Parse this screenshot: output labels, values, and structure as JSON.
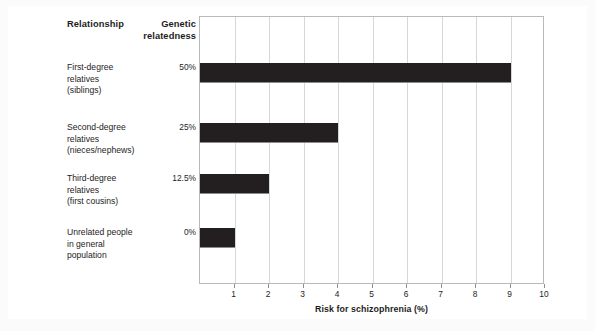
{
  "chart_data": {
    "type": "bar",
    "orientation": "horizontal",
    "title": "",
    "xlabel": "Risk for schizophrenia (%)",
    "ylabel": "",
    "xlim": [
      0,
      10
    ],
    "xticks": [
      "1",
      "2",
      "3",
      "4",
      "5",
      "6",
      "7",
      "8",
      "9",
      "10"
    ],
    "xtick_values": [
      1,
      2,
      3,
      4,
      5,
      6,
      7,
      8,
      9,
      10
    ],
    "grid": "vertical",
    "legend": "none",
    "bar_color": "#231f20",
    "categories": [
      "First-degree relatives (siblings)",
      "Second-degree relatives (nieces/nephews)",
      "Third-degree relatives (first cousins)",
      "Unrelated people in general population"
    ],
    "values": [
      9,
      4,
      2,
      1
    ],
    "series": [
      {
        "name": "Risk for schizophrenia (%)",
        "values": [
          9,
          4,
          2,
          1
        ]
      }
    ]
  },
  "columns": {
    "relationship_header": "Relationship",
    "genetic_header_line1": "Genetic",
    "genetic_header_line2": "relatedness"
  },
  "rows": [
    {
      "label_line1": "First-degree",
      "label_line2": "relatives",
      "label_line3": "(siblings)",
      "relatedness": "50%",
      "risk": 9
    },
    {
      "label_line1": "Second-degree",
      "label_line2": "relatives",
      "label_line3": "(nieces/nephews)",
      "relatedness": "25%",
      "risk": 4
    },
    {
      "label_line1": "Third-degree",
      "label_line2": "relatives",
      "label_line3": "(first cousins)",
      "relatedness": "12.5%",
      "risk": 2
    },
    {
      "label_line1": "Unrelated people",
      "label_line2": "in general",
      "label_line3": "population",
      "relatedness": "0%",
      "risk": 1
    }
  ],
  "axis": {
    "title": "Risk for schizophrenia (%)"
  }
}
